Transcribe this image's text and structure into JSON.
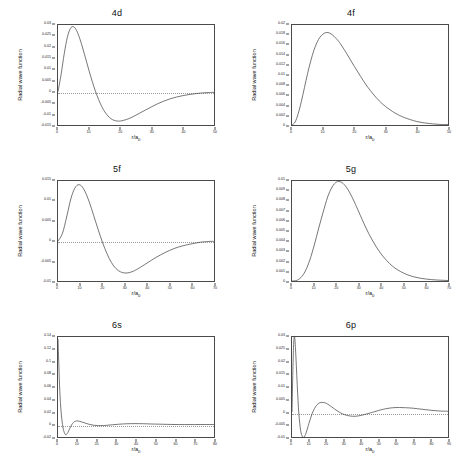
{
  "figure": {
    "axis_labels": {
      "x": "r/a",
      "x_sub": "0",
      "y": "Radial wave function"
    }
  },
  "chart_data": [
    {
      "type": "line",
      "title": "4d",
      "xlabel": "r/a0",
      "ylabel": "Radial wave function",
      "xlim": [
        0,
        50
      ],
      "ylim": [
        -0.015,
        0.03
      ],
      "xticks": [
        0,
        10,
        20,
        30,
        40,
        50
      ],
      "yticks": [
        -0.015,
        -0.01,
        -0.005,
        0,
        0.005,
        0.01,
        0.015,
        0.02,
        0.025,
        0.03
      ],
      "ytick_labels": [
        "-0.015",
        "-0.01",
        "-0.005",
        "0",
        "0.005",
        "0.01",
        "0.015",
        "0.02",
        "0.025",
        "0.03"
      ],
      "grid": false,
      "zero_line": true,
      "x": [
        0,
        1,
        2,
        3,
        4,
        5,
        6,
        7,
        8,
        9,
        10,
        11,
        12,
        13,
        14,
        15,
        16,
        17,
        18,
        19,
        20,
        22,
        24,
        26,
        28,
        30,
        32,
        34,
        36,
        38,
        40,
        42,
        44,
        46,
        48,
        50
      ],
      "y": [
        0,
        0.0078,
        0.0171,
        0.0245,
        0.0285,
        0.0292,
        0.0274,
        0.0238,
        0.0192,
        0.0142,
        0.0092,
        0.0045,
        0.0002,
        -0.0035,
        -0.0066,
        -0.0091,
        -0.0109,
        -0.0122,
        -0.0129,
        -0.0132,
        -0.0132,
        -0.0125,
        -0.0113,
        -0.0098,
        -0.0083,
        -0.0068,
        -0.0054,
        -0.0042,
        -0.0032,
        -0.0024,
        -0.0018,
        -0.0013,
        -0.0009,
        -0.0006,
        -0.0004,
        -0.0003
      ]
    },
    {
      "type": "line",
      "title": "4f",
      "xlabel": "r/a0",
      "ylabel": "Radial wave function",
      "xlim": [
        0,
        50
      ],
      "ylim": [
        0,
        0.02
      ],
      "xticks": [
        0,
        10,
        20,
        30,
        40,
        50
      ],
      "yticks": [
        0,
        0.002,
        0.004,
        0.006,
        0.008,
        0.01,
        0.012,
        0.014,
        0.016,
        0.018,
        0.02
      ],
      "ytick_labels": [
        "0",
        "0.002",
        "0.004",
        "0.006",
        "0.008",
        "0.01",
        "0.012",
        "0.014",
        "0.016",
        "0.018",
        "0.02"
      ],
      "grid": false,
      "zero_line": false,
      "x": [
        0,
        1,
        2,
        3,
        4,
        5,
        6,
        7,
        8,
        9,
        10,
        11,
        12,
        13,
        14,
        15,
        16,
        18,
        20,
        22,
        24,
        26,
        28,
        30,
        33,
        36,
        40,
        44,
        48,
        50
      ],
      "y": [
        0,
        0.0006,
        0.0023,
        0.0047,
        0.0075,
        0.0103,
        0.0128,
        0.0149,
        0.0165,
        0.0176,
        0.0182,
        0.0185,
        0.0184,
        0.018,
        0.0174,
        0.0167,
        0.0158,
        0.0138,
        0.0117,
        0.0097,
        0.0078,
        0.0062,
        0.0048,
        0.0037,
        0.0024,
        0.0015,
        0.0007,
        0.0003,
        0.0001,
        0.0001
      ]
    },
    {
      "type": "line",
      "title": "5f",
      "xlabel": "r/a0",
      "ylabel": "Radial wave function",
      "xlim": [
        0,
        70
      ],
      "ylim": [
        -0.01,
        0.015
      ],
      "xticks": [
        0,
        10,
        20,
        30,
        40,
        50,
        60,
        70
      ],
      "yticks": [
        -0.01,
        -0.005,
        0,
        0.005,
        0.01,
        0.015
      ],
      "ytick_labels": [
        "-0.01",
        "-0.005",
        "0",
        "0.005",
        "0.01",
        "0.015"
      ],
      "grid": false,
      "zero_line": true,
      "x": [
        0,
        2,
        4,
        6,
        8,
        10,
        12,
        14,
        16,
        18,
        20,
        22,
        24,
        26,
        28,
        30,
        32,
        34,
        36,
        40,
        44,
        48,
        52,
        56,
        60,
        64,
        68,
        70
      ],
      "y": [
        0,
        0.0019,
        0.0063,
        0.011,
        0.0136,
        0.014,
        0.0125,
        0.0098,
        0.0064,
        0.0029,
        -0.0004,
        -0.0032,
        -0.0054,
        -0.0069,
        -0.0077,
        -0.008,
        -0.0079,
        -0.0075,
        -0.0069,
        -0.0055,
        -0.0041,
        -0.0029,
        -0.0019,
        -0.0012,
        -0.0007,
        -0.0003,
        -0.0001,
        -0.0001
      ]
    },
    {
      "type": "line",
      "title": "5g",
      "xlabel": "r/a0",
      "ylabel": "Radial wave function",
      "xlim": [
        0,
        70
      ],
      "ylim": [
        0,
        0.01
      ],
      "xticks": [
        0,
        10,
        20,
        30,
        40,
        50,
        60,
        70
      ],
      "yticks": [
        0,
        0.001,
        0.002,
        0.003,
        0.004,
        0.005,
        0.006,
        0.007,
        0.008,
        0.009,
        0.01
      ],
      "ytick_labels": [
        "0",
        "0.001",
        "0.002",
        "0.003",
        "0.004",
        "0.005",
        "0.006",
        "0.007",
        "0.008",
        "0.009",
        "0.01"
      ],
      "grid": false,
      "zero_line": false,
      "x": [
        0,
        2,
        4,
        6,
        8,
        10,
        12,
        14,
        16,
        18,
        20,
        22,
        24,
        26,
        28,
        30,
        33,
        36,
        40,
        45,
        50,
        55,
        60,
        65,
        70
      ],
      "y": [
        0,
        5e-05,
        0.00035,
        0.001,
        0.0021,
        0.0036,
        0.0053,
        0.0069,
        0.0084,
        0.0094,
        0.0099,
        0.0099,
        0.0095,
        0.0088,
        0.0079,
        0.0069,
        0.0054,
        0.0041,
        0.0027,
        0.0015,
        0.0008,
        0.0004,
        0.0002,
        0.0001,
        5e-05
      ]
    },
    {
      "type": "line",
      "title": "6s",
      "xlabel": "r/a0",
      "ylabel": "Radial wave function",
      "xlim": [
        0,
        80
      ],
      "ylim": [
        -0.02,
        0.14
      ],
      "xticks": [
        0,
        10,
        20,
        30,
        40,
        50,
        60,
        70,
        80
      ],
      "yticks": [
        -0.02,
        0,
        0.02,
        0.04,
        0.06,
        0.08,
        0.1,
        0.12,
        0.14
      ],
      "ytick_labels": [
        "-0.02",
        "0",
        "0.02",
        "0.04",
        "0.06",
        "0.08",
        "0.1",
        "0.12",
        "0.14"
      ],
      "grid": false,
      "zero_line": true,
      "x": [
        0,
        0.3,
        0.8,
        1.4,
        2,
        2.6,
        3.2,
        4,
        5,
        6,
        7,
        8,
        9,
        10,
        12,
        14,
        16,
        18,
        20,
        22,
        25,
        28,
        31,
        34,
        37,
        40,
        44,
        48,
        52,
        56,
        60,
        65,
        70,
        75,
        80
      ],
      "y": [
        0.137,
        0.108,
        0.062,
        0.028,
        0.0075,
        -0.0055,
        -0.0125,
        -0.0165,
        -0.013,
        -0.0065,
        -0.0005,
        0.0035,
        0.0053,
        0.0057,
        0.0043,
        0.0022,
        0.0003,
        -0.001,
        -0.0017,
        -0.0018,
        -0.0013,
        -0.0004,
        0.0004,
        0.001,
        0.0013,
        0.0014,
        0.0012,
        0.0008,
        0.0005,
        0.0002,
        0.0,
        -0.0001,
        -0.0001,
        0.0,
        0.0
      ]
    },
    {
      "type": "line",
      "title": "6p",
      "xlabel": "r/a0",
      "ylabel": "Radial wave function",
      "xlim": [
        0,
        90
      ],
      "ylim": [
        -0.01,
        0.03
      ],
      "xticks": [
        0,
        10,
        20,
        30,
        40,
        50,
        60,
        70,
        80,
        90
      ],
      "yticks": [
        -0.01,
        -0.005,
        0,
        0.005,
        0.01,
        0.015,
        0.02,
        0.025,
        0.03
      ],
      "ytick_labels": [
        "-0.01",
        "-0.005",
        "0",
        "0.005",
        "0.01",
        "0.015",
        "0.02",
        "0.025",
        "0.03"
      ],
      "grid": false,
      "zero_line": true,
      "x": [
        0,
        0.5,
        1,
        1.5,
        2,
        2.5,
        3,
        3.5,
        4,
        5,
        6,
        7,
        8,
        9,
        10,
        12,
        14,
        16,
        18,
        20,
        23,
        26,
        29,
        32,
        35,
        38,
        42,
        46,
        50,
        54,
        58,
        62,
        66,
        70,
        75,
        80,
        85,
        90
      ],
      "y": [
        0,
        0.0165,
        0.028,
        0.03,
        0.0255,
        0.0185,
        0.011,
        0.0045,
        -0.001,
        -0.0075,
        -0.0098,
        -0.01,
        -0.0086,
        -0.0064,
        -0.004,
        0.0,
        0.0025,
        0.0037,
        0.0038,
        0.0034,
        0.002,
        0.0005,
        -0.0007,
        -0.0014,
        -0.0017,
        -0.0016,
        -0.001,
        -0.0002,
        0.0006,
        0.0013,
        0.0017,
        0.0018,
        0.0017,
        0.0015,
        0.0011,
        0.0007,
        0.0004,
        0.0003
      ]
    }
  ]
}
